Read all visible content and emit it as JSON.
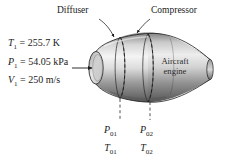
{
  "figure": {
    "background_color": "#ffffff",
    "line_color": "#1a1a1a",
    "body_light": "#f2f2f2",
    "body_mid": "#b9b9b9",
    "body_dark": "#6e6e6e",
    "body_darkest": "#4a4a4a"
  },
  "callouts": {
    "diffuser": "Diffuser",
    "compressor": "Compressor",
    "engine": "Aircraft engine"
  },
  "inlet_state": {
    "temperature": {
      "symbol": "T",
      "subscript": "1",
      "equals": "=",
      "value": "255.7",
      "unit": "K",
      "text": "T1 = 255.7 K"
    },
    "pressure": {
      "symbol": "P",
      "subscript": "1",
      "equals": "=",
      "value": "54.05",
      "unit": "kPa",
      "text": "P1 = 54.05 kPa"
    },
    "velocity": {
      "symbol": "V",
      "subscript": "1",
      "equals": "=",
      "value": "250",
      "unit": "m/s",
      "text": "V1 = 250 m/s"
    }
  },
  "stations": [
    {
      "id": "station-01",
      "pressure_symbol": "P",
      "pressure_subscript": "01",
      "temperature_symbol": "T",
      "temperature_subscript": "01"
    },
    {
      "id": "station-02",
      "pressure_symbol": "P",
      "pressure_subscript": "02",
      "temperature_symbol": "T",
      "temperature_subscript": "02"
    }
  ],
  "icons": {
    "inlet_flow_arrow": "arrow-right-icon",
    "diffuser_leader": "leader-arrow-icon",
    "compressor_leader": "leader-arrow-icon",
    "station_dashed_line": "dashed-line-icon"
  }
}
